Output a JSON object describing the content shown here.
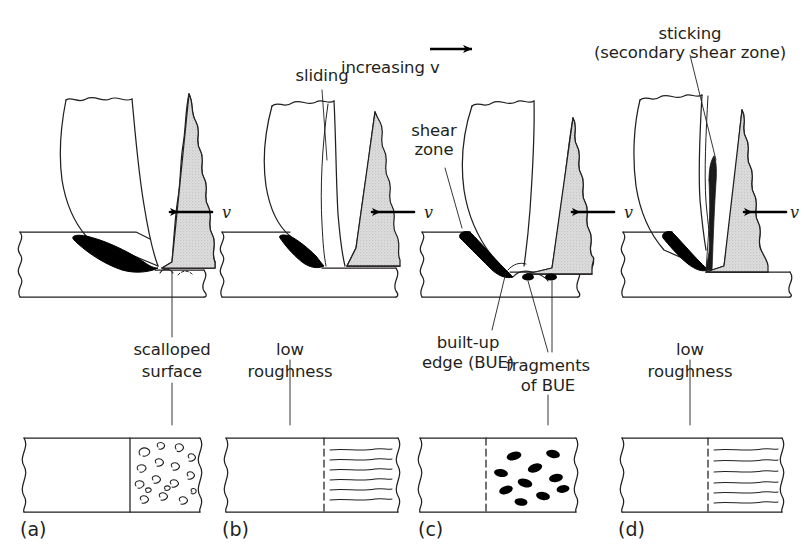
{
  "figure": {
    "title_text": "",
    "background_color": "#ffffff",
    "ink_color": "#231f20",
    "tool_fill_color": "#d9d9d9",
    "bue_fill_color": "#000000",
    "chip_fill_color": "#ffffff"
  },
  "top_labels": {
    "increasing_v": "increasing v",
    "increasing_v_arrow": "→",
    "sliding": "sliding",
    "shear_zone_line1": "shear",
    "shear_zone_line2": "zone",
    "sticking_line1": "sticking",
    "sticking_line2": "(secondary shear zone)"
  },
  "velocity_labels": {
    "a": "v",
    "b": "v",
    "c": "v",
    "d": "v"
  },
  "callouts": {
    "scalloped_surface_line1": "scalloped",
    "scalloped_surface_line2": "surface",
    "low_roughness_b_line1": "low",
    "low_roughness_b_line2": "roughness",
    "built_up_edge_line1": "built-up",
    "built_up_edge_line2": "edge (BUE)",
    "fragments_line1": "fragments",
    "fragments_line2": "of BUE",
    "low_roughness_d_line1": "low",
    "low_roughness_d_line2": "roughness"
  },
  "panels": [
    {
      "id": "a",
      "letter": "(a)",
      "surface_pattern": "scalloped-voids",
      "surface_label": "scalloped surface",
      "regime": "built-up edge forms, scalloped machined surface"
    },
    {
      "id": "b",
      "letter": "(b)",
      "surface_pattern": "smooth-striations",
      "surface_label": "low roughness",
      "regime": "sliding at tool-chip interface, low roughness"
    },
    {
      "id": "c",
      "letter": "(c)",
      "surface_pattern": "bue-fragments",
      "surface_label": "fragments of BUE",
      "regime": "built-up edge (BUE) with fragments on surface"
    },
    {
      "id": "d",
      "letter": "(d)",
      "surface_pattern": "smooth-striations",
      "surface_label": "low roughness",
      "regime": "sticking / secondary shear zone, low roughness"
    }
  ]
}
